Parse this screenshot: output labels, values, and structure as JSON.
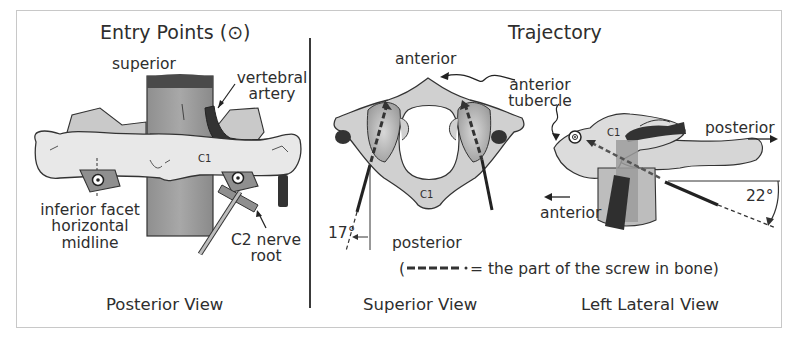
{
  "panels": {
    "entry_points": {
      "title": "Entry Points",
      "title_symbol": "(⊙)",
      "view_label": "Posterior View",
      "labels": {
        "superior": "superior",
        "vertebral_artery_1": "vertebral",
        "vertebral_artery_2": "artery",
        "c1": "C1",
        "inferior_facet_1": "inferior facet",
        "inferior_facet_2": "horizontal",
        "inferior_facet_3": "midline",
        "c2_nerve_1": "C2 nerve",
        "c2_nerve_2": "root"
      }
    },
    "trajectory": {
      "title": "Trajectory",
      "superior_view": {
        "view_label": "Superior View",
        "labels": {
          "anterior": "anterior",
          "posterior": "posterior",
          "c1": "C1",
          "angle": "17°"
        }
      },
      "lateral_view": {
        "view_label": "Left Lateral View",
        "labels": {
          "anterior_tubercle_1": "anterior",
          "anterior_tubercle_2": "tubercle",
          "posterior": "posterior",
          "anterior": "anterior",
          "c1": "C1",
          "angle": "22°"
        }
      },
      "legend": {
        "open": "(",
        "text": "= the part of the screw in bone)"
      }
    }
  },
  "colors": {
    "bone_light": "#e6e6e6",
    "bone_mid": "#c9c9c9",
    "bone_dark": "#a9a9a9",
    "artery": "#3a3a3a",
    "ink": "#2e2e2e",
    "frame": "#c8c8c8"
  }
}
